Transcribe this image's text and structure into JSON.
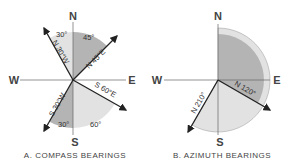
{
  "diagram_a": {
    "caption": "A. COMPASS BEARINGS",
    "cardinals": {
      "n": "N",
      "e": "E",
      "s": "S",
      "w": "W"
    },
    "bearings": [
      {
        "label": "N 30°W",
        "angle_label": "30°"
      },
      {
        "label": "N 45°E",
        "angle_label": "45°"
      },
      {
        "label": "S 60°E",
        "angle_label": "60°"
      },
      {
        "label": "S 30°W",
        "angle_label": "30°"
      }
    ]
  },
  "diagram_b": {
    "caption": "B. AZIMUTH BEARINGS",
    "cardinals": {
      "n": "N",
      "e": "E",
      "s": "S",
      "w": "W"
    },
    "bearings": [
      {
        "label": "N 120°"
      },
      {
        "label": "N 210°"
      }
    ]
  },
  "colors": {
    "dark_fill": "#b4b4b4",
    "light_fill": "#e2e2e2",
    "line": "#222222"
  }
}
